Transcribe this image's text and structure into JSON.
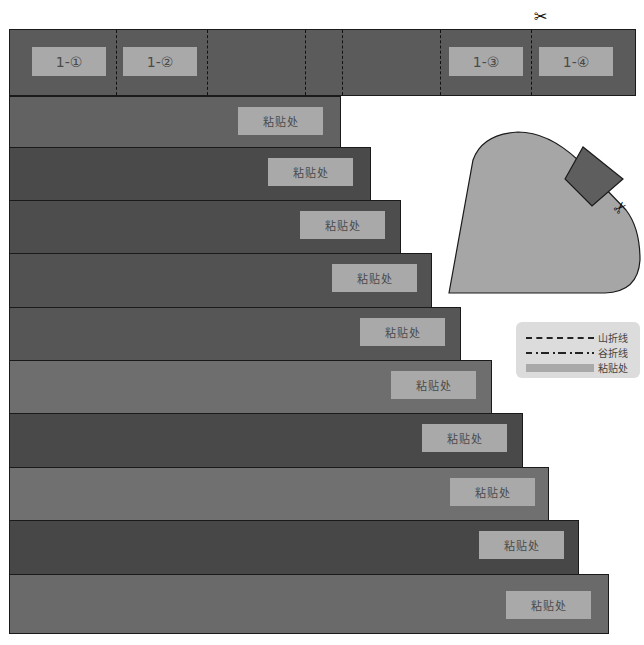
{
  "top_strip": {
    "labels": [
      "1-①",
      "1-②",
      "1-③",
      "1-④"
    ]
  },
  "strips": [
    {
      "glue_label": "粘贴处",
      "color": "#626262"
    },
    {
      "glue_label": "粘贴处",
      "color": "#4a4a4a"
    },
    {
      "glue_label": "粘贴处",
      "color": "#4d4d4d"
    },
    {
      "glue_label": "粘贴处",
      "color": "#525252"
    },
    {
      "glue_label": "粘贴处",
      "color": "#565656"
    },
    {
      "glue_label": "粘贴处",
      "color": "#6e6e6e"
    },
    {
      "glue_label": "粘贴处",
      "color": "#494949"
    },
    {
      "glue_label": "粘贴处",
      "color": "#707070"
    },
    {
      "glue_label": "粘贴处",
      "color": "#474747"
    },
    {
      "glue_label": "粘贴处",
      "color": "#6a6a6a"
    }
  ],
  "legend": {
    "mountain_fold": "山折线",
    "valley_fold": "谷折线",
    "glue_area": "粘贴处"
  },
  "icons": {
    "scissors": "✂"
  },
  "colors": {
    "glue": "#a9a9a9",
    "top_strip": "#5b5b5b",
    "shape_fill": "#a6a6a6",
    "tab_fill": "#5e5e5e",
    "legend_bg": "#dcdcdc"
  }
}
